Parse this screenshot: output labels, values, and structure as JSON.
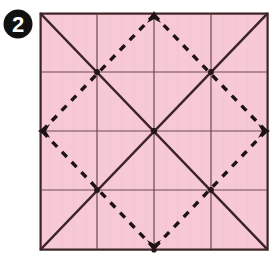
{
  "figure": {
    "step_badge": {
      "name": "step-number-badge",
      "label": "2",
      "circle_color": "#111111",
      "text_color": "#ffffff",
      "cx": 18,
      "cy": 24,
      "r": 14
    },
    "paper": {
      "name": "paper-square",
      "fill_color": "#f7c8d6",
      "border_color": "#3b2326",
      "x": 40,
      "y": 13,
      "width": 228,
      "height": 237
    },
    "grid": {
      "name": "grid-lines",
      "color": "#6b4a50",
      "divisions": 4,
      "vertical_x": [
        97,
        154,
        211
      ],
      "horizontal_y": [
        72,
        131,
        190
      ],
      "stroke_width": 1.2
    },
    "diagonals": {
      "name": "solid-diagonal-creases",
      "color": "#3b2326",
      "style": "solid",
      "stroke_width": 2.4,
      "lines": [
        {
          "label": "top-left-to-bottom-right",
          "x1": 40,
          "y1": 13,
          "x2": 268,
          "y2": 250
        },
        {
          "label": "bottom-left-to-top-right",
          "x1": 40,
          "y1": 250,
          "x2": 268,
          "y2": 13
        }
      ]
    },
    "dashed_diamond": {
      "name": "dashed-fold-diamond",
      "color": "#1d1214",
      "style": "dashed",
      "stroke_width": 3.2,
      "dash_pattern": "7 7",
      "vertices": [
        {
          "label": "top-midpoint",
          "x": 154,
          "y": 13
        },
        {
          "label": "right-midpoint",
          "x": 268,
          "y": 131
        },
        {
          "label": "bottom-midpoint",
          "x": 154,
          "y": 250
        },
        {
          "label": "left-midpoint",
          "x": 40,
          "y": 131
        }
      ]
    },
    "arrowheads": [
      {
        "name": "arrowhead-top",
        "x": 154,
        "y": 13,
        "direction": "up"
      },
      {
        "name": "arrowhead-right",
        "x": 268,
        "y": 131,
        "direction": "right"
      },
      {
        "name": "arrowhead-bottom",
        "x": 154,
        "y": 250,
        "direction": "down"
      },
      {
        "name": "arrowhead-left",
        "x": 40,
        "y": 131,
        "direction": "left"
      }
    ],
    "intersection_dots": [
      {
        "name": "dot-center",
        "x": 154,
        "y": 131
      },
      {
        "name": "dot-upper-left",
        "x": 97,
        "y": 72
      },
      {
        "name": "dot-upper-right",
        "x": 211,
        "y": 72
      },
      {
        "name": "dot-lower-left",
        "x": 97,
        "y": 190
      },
      {
        "name": "dot-lower-right",
        "x": 211,
        "y": 190
      }
    ]
  }
}
